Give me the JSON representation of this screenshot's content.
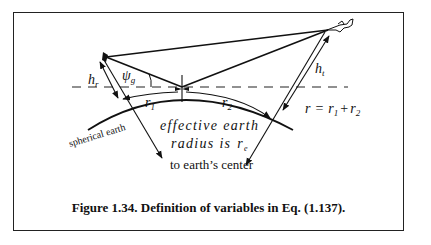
{
  "figure": {
    "caption": "Figure 1.34. Definition of variables in Eq. (1.137).",
    "labels": {
      "h_r": "h",
      "h_r_sub": "r",
      "psi_g": "ψ",
      "psi_g_sub": "g",
      "r1": "r",
      "r1_sub": "1",
      "r2": "r",
      "r2_sub": "2",
      "h_t": "h",
      "h_t_sub": "t",
      "equation_r": "r",
      "equation_eq": "=",
      "equation_r1": "r",
      "equation_r1_sub": "1",
      "equation_plus": "+",
      "equation_r2": "r",
      "equation_r2_sub": "2",
      "spherical_earth": "spherical earth",
      "effective_line1": "effective earth",
      "effective_line2": "radius is",
      "effective_re": "r",
      "effective_re_sub": "e",
      "to_center": "to earth’s center"
    },
    "elements": [
      "radar-antenna",
      "aircraft-target",
      "direct-path-line",
      "reflected-path-lines",
      "specular-point-cross",
      "horizon-dashed-line",
      "earth-surface-arc",
      "radius-arrows"
    ]
  }
}
